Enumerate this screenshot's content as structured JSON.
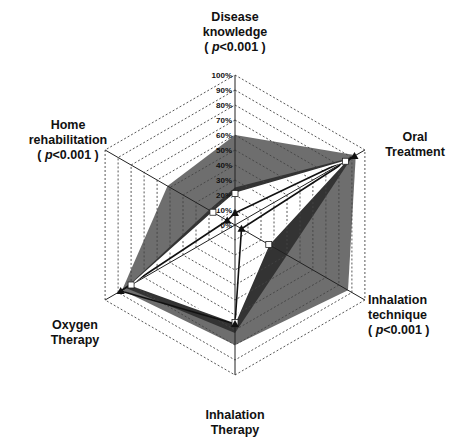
{
  "chart_data": {
    "type": "radar",
    "title": "",
    "axes": [
      {
        "label": "Disease knowledge",
        "annotation": "( p<0.001 )"
      },
      {
        "label": "Oral Treatment",
        "annotation": ""
      },
      {
        "label": "Inhalation technique",
        "annotation": "( p<0.001 )"
      },
      {
        "label": "Inhalation Therapy",
        "annotation": ""
      },
      {
        "label": "Oxygen Therapy",
        "annotation": ""
      },
      {
        "label": "Home rehabilitation",
        "annotation": "( p<0.001 )"
      }
    ],
    "radial_ticks": [
      "0%",
      "10%",
      "20%",
      "30%",
      "40%",
      "50%",
      "60%",
      "70%",
      "80%",
      "90%",
      "100%"
    ],
    "range": [
      0,
      100
    ],
    "grid": "dashed hexagon",
    "series": [
      {
        "name": "outer-gray-area",
        "color": "#6e6e6e",
        "values": [
          60,
          93,
          87,
          80,
          87,
          52
        ]
      },
      {
        "name": "dark-band-area",
        "color": "#333333",
        "values": [
          25,
          90,
          40,
          72,
          84,
          20
        ]
      },
      {
        "name": "white-square-line",
        "color": "#ffffff",
        "marker": "square",
        "values": [
          21,
          85,
          26,
          65,
          80,
          17
        ]
      },
      {
        "name": "black-triangle-line",
        "color": "#111111",
        "marker": "triangle",
        "values": [
          8,
          92,
          5,
          66,
          88,
          6
        ]
      }
    ]
  },
  "labels": {
    "disease": [
      "Disease",
      "knowledge"
    ],
    "oral": [
      "Oral",
      "Treatment"
    ],
    "technique": [
      "Inhalation",
      "technique"
    ],
    "therapy": [
      "Inhalation",
      "Therapy"
    ],
    "oxygen": [
      "Oxygen",
      "Therapy"
    ],
    "home": [
      "Home",
      "rehabilitation"
    ],
    "p_open": "( ",
    "p_sym": "p",
    "p_rest": "<0.001 )"
  }
}
